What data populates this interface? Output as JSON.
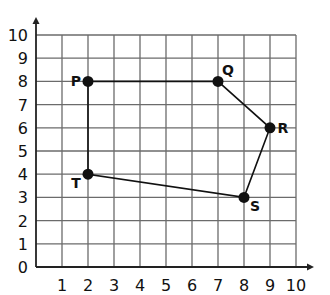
{
  "chart_data": {
    "type": "scatter",
    "title": "",
    "xlabel": "",
    "ylabel": "",
    "xlim": [
      0,
      10
    ],
    "ylim": [
      0,
      10
    ],
    "grid": true,
    "x_ticks": [
      "1",
      "2",
      "3",
      "4",
      "5",
      "6",
      "7",
      "8",
      "9",
      "10"
    ],
    "y_ticks": [
      "0",
      "1",
      "2",
      "3",
      "4",
      "5",
      "6",
      "7",
      "8",
      "9",
      "10"
    ],
    "points": [
      {
        "label": "P",
        "x": 2,
        "y": 8
      },
      {
        "label": "Q",
        "x": 7,
        "y": 8
      },
      {
        "label": "R",
        "x": 9,
        "y": 6
      },
      {
        "label": "S",
        "x": 8,
        "y": 3
      },
      {
        "label": "T",
        "x": 2,
        "y": 4
      }
    ],
    "polygon": [
      "P",
      "Q",
      "R",
      "S",
      "T"
    ],
    "polygon_closed": true
  },
  "colors": {
    "grid": "#6b6b6b",
    "axis": "#222222",
    "shape": "#111111",
    "text": "#111111"
  }
}
